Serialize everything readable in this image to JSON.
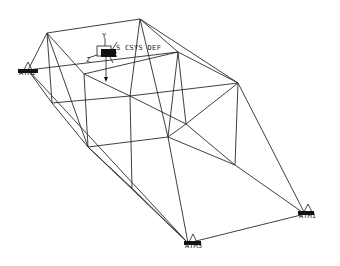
{
  "viewport": {
    "background": "#ffffff",
    "line_color": "#2a2a2a"
  },
  "nodes": {
    "A": [
      47,
      33
    ],
    "B": [
      140,
      19
    ],
    "C": [
      84,
      74
    ],
    "D": [
      178,
      52
    ],
    "E": [
      238,
      83
    ],
    "F": [
      52,
      103
    ],
    "G": [
      130,
      96
    ],
    "H": [
      186,
      124
    ],
    "I": [
      88,
      147
    ],
    "J": [
      168,
      137
    ],
    "L": [
      235,
      165
    ],
    "M": [
      132,
      188
    ],
    "S2": [
      28,
      70
    ],
    "S1": [
      305,
      214
    ],
    "S3": [
      188,
      243
    ]
  },
  "edges": [
    [
      "A",
      "B"
    ],
    [
      "B",
      "E"
    ],
    [
      "A",
      "S2"
    ],
    [
      "A",
      "C"
    ],
    [
      "A",
      "F"
    ],
    [
      "A",
      "I"
    ],
    [
      "B",
      "D"
    ],
    [
      "B",
      "G"
    ],
    [
      "B",
      "J"
    ],
    [
      "S2",
      "D"
    ],
    [
      "D",
      "E"
    ],
    [
      "C",
      "D"
    ],
    [
      "D",
      "J"
    ],
    [
      "D",
      "H"
    ],
    [
      "C",
      "I"
    ],
    [
      "C",
      "G"
    ],
    [
      "F",
      "G"
    ],
    [
      "F",
      "S2"
    ],
    [
      "F",
      "I"
    ],
    [
      "G",
      "E"
    ],
    [
      "G",
      "H"
    ],
    [
      "G",
      "M"
    ],
    [
      "E",
      "L"
    ],
    [
      "E",
      "H"
    ],
    [
      "E",
      "S1"
    ],
    [
      "I",
      "J"
    ],
    [
      "I",
      "M"
    ],
    [
      "I",
      "S3"
    ],
    [
      "J",
      "L"
    ],
    [
      "J",
      "H"
    ],
    [
      "J",
      "S3"
    ],
    [
      "H",
      "L"
    ],
    [
      "L",
      "S1"
    ],
    [
      "M",
      "S3"
    ],
    [
      "S2",
      "S3"
    ],
    [
      "S3",
      "S1"
    ]
  ],
  "coordinate_system": {
    "label": "CS_CSYS_DEF",
    "visible_label": "S CSYS DEF",
    "axes": {
      "x": "X",
      "y": "Y",
      "z": "Z"
    },
    "origin": [
      108,
      52
    ]
  },
  "supports": [
    {
      "id": "ATM2",
      "label": "ATM2",
      "position": [
        28,
        70
      ]
    },
    {
      "id": "ATM1",
      "label": "ATM1",
      "position": [
        305,
        214
      ]
    },
    {
      "id": "ATM3",
      "label": "ATM3",
      "position": [
        188,
        243
      ]
    }
  ],
  "load_arrow": {
    "from": [
      106,
      52
    ],
    "to": [
      106,
      80
    ]
  }
}
